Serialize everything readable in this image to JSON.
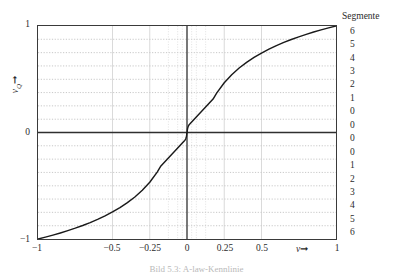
{
  "figure": {
    "caption": "Bild 5.3: A-law-Kennlinie"
  },
  "axes": {
    "x": {
      "name": "v",
      "arrow": "➞",
      "min": -1,
      "max": 1,
      "ticks": [
        {
          "value": -1,
          "label": "−1"
        },
        {
          "value": -0.5,
          "label": "−0.5"
        },
        {
          "value": -0.25,
          "label": "−0.25"
        },
        {
          "value": 0,
          "label": "0"
        },
        {
          "value": 0.25,
          "label": "0.25"
        },
        {
          "value": 0.5,
          "label": "0.5"
        },
        {
          "value": 1,
          "label": "1"
        }
      ]
    },
    "y": {
      "name": "v",
      "name_sub": "Q",
      "arrow": "➞",
      "min": -1,
      "max": 1,
      "ticks": [
        {
          "value": 1,
          "label": "1"
        },
        {
          "value": 0,
          "label": "0"
        },
        {
          "value": -1,
          "label": "−1"
        }
      ]
    },
    "right": {
      "title": "Segmente",
      "labels": [
        {
          "value": 0.9375,
          "label": "6"
        },
        {
          "value": 0.8125,
          "label": "5"
        },
        {
          "value": 0.6875,
          "label": "4"
        },
        {
          "value": 0.5625,
          "label": "3"
        },
        {
          "value": 0.4375,
          "label": "2"
        },
        {
          "value": 0.3125,
          "label": "1"
        },
        {
          "value": 0.1875,
          "label": "0"
        },
        {
          "value": 0.0625,
          "label": "0"
        },
        {
          "value": -0.0625,
          "label": "0"
        },
        {
          "value": -0.1875,
          "label": "0"
        },
        {
          "value": -0.3125,
          "label": "1"
        },
        {
          "value": -0.4375,
          "label": "2"
        },
        {
          "value": -0.5625,
          "label": "3"
        },
        {
          "value": -0.6875,
          "label": "4"
        },
        {
          "value": -0.8125,
          "label": "5"
        },
        {
          "value": -0.9375,
          "label": "6"
        }
      ]
    }
  },
  "style": {
    "curve_color": "#1a1a1a",
    "frame_color": "#3a3a3a",
    "axis_color": "#2f2f2f",
    "grid_color": "#9a9a9a",
    "grid_minor_color": "#c4c4c4",
    "background": "#ffffff"
  },
  "chart_data": {
    "type": "line",
    "title": "",
    "xlabel": "v",
    "ylabel": "vQ",
    "xlim": [
      -1,
      1
    ],
    "ylim": [
      -1,
      1
    ],
    "grid": true,
    "legend": null,
    "series": [
      {
        "name": "A-law companding characteristic",
        "x": [
          -1.0,
          -0.95,
          -0.9,
          -0.85,
          -0.8,
          -0.75,
          -0.7,
          -0.65,
          -0.6,
          -0.55,
          -0.5,
          -0.45,
          -0.4,
          -0.35,
          -0.3,
          -0.25,
          -0.2,
          -0.175,
          -0.15,
          -0.125,
          -0.1,
          -0.0875,
          -0.075,
          -0.0625,
          -0.05,
          -0.04375,
          -0.0375,
          -0.03125,
          -0.025,
          -0.02,
          -0.015625,
          -0.0125,
          -0.01,
          -0.0078125,
          -0.00625,
          -0.005,
          -0.00390625,
          -0.003125,
          -0.0025,
          -0.001953125,
          -0.0015625,
          -0.001,
          -0.0005,
          0.0,
          0.0005,
          0.001,
          0.0015625,
          0.001953125,
          0.0025,
          0.003125,
          0.00390625,
          0.005,
          0.00625,
          0.0078125,
          0.01,
          0.0125,
          0.015625,
          0.02,
          0.025,
          0.03125,
          0.0375,
          0.04375,
          0.05,
          0.0625,
          0.075,
          0.0875,
          0.1,
          0.125,
          0.15,
          0.175,
          0.2,
          0.25,
          0.3,
          0.35,
          0.4,
          0.45,
          0.5,
          0.55,
          0.6,
          0.65,
          0.7,
          0.75,
          0.8,
          0.85,
          0.9,
          0.95,
          1.0
        ],
        "y": [
          -1.0,
          -0.9823,
          -0.9634,
          -0.9433,
          -0.9216,
          -0.8983,
          -0.8731,
          -0.8457,
          -0.8157,
          -0.7827,
          -0.7461,
          -0.7052,
          -0.6589,
          -0.6056,
          -0.5429,
          -0.467,
          -0.3715,
          -0.3135,
          -0.276,
          -0.2386,
          -0.2011,
          -0.1824,
          -0.1636,
          -0.1449,
          -0.1262,
          -0.1168,
          -0.1074,
          -0.0981,
          -0.0887,
          -0.0812,
          -0.075,
          -0.0687,
          -0.0625,
          -0.0562,
          -0.05,
          -0.0437,
          -0.0375,
          -0.0312,
          -0.025,
          -0.0187,
          -0.0125,
          -0.01,
          -0.005,
          0.0,
          0.005,
          0.01,
          0.0125,
          0.0187,
          0.025,
          0.0312,
          0.0375,
          0.0437,
          0.05,
          0.0562,
          0.0625,
          0.0687,
          0.075,
          0.0812,
          0.0887,
          0.0981,
          0.1074,
          0.1168,
          0.1262,
          0.1449,
          0.1636,
          0.1824,
          0.2011,
          0.2386,
          0.276,
          0.3135,
          0.3715,
          0.467,
          0.5429,
          0.6056,
          0.6589,
          0.7052,
          0.7461,
          0.7827,
          0.8157,
          0.8457,
          0.8731,
          0.8983,
          0.9216,
          0.9433,
          0.9634,
          0.9823,
          1.0
        ]
      }
    ],
    "gridlines": {
      "x_major": [
        -1,
        -0.5,
        -0.25,
        0,
        0.25,
        0.5,
        1
      ],
      "x_minor": [
        -0.125,
        -0.0625,
        -0.03125,
        -0.015625,
        0.015625,
        0.03125,
        0.0625,
        0.125
      ],
      "y_major": [
        0
      ],
      "y_minor": [
        -0.875,
        -0.75,
        -0.625,
        -0.5,
        -0.375,
        -0.25,
        -0.125,
        0.125,
        0.25,
        0.375,
        0.5,
        0.625,
        0.75,
        0.875
      ]
    }
  }
}
